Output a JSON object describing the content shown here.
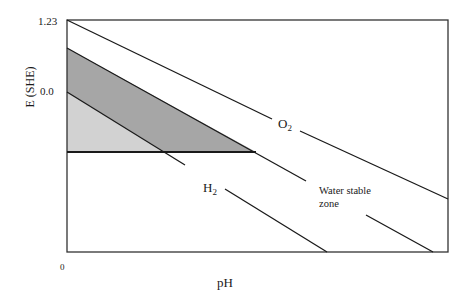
{
  "diagram": {
    "type": "pourbaix_water_stability",
    "y_axis": {
      "label": "E (SHE)",
      "ticks": [
        "1.23",
        "0.0"
      ]
    },
    "x_axis": {
      "label": "pH",
      "ticks": [
        "0"
      ]
    },
    "lines": {
      "o2": {
        "label": "O",
        "subscript": "2"
      },
      "h2": {
        "label": "H",
        "subscript": "2"
      }
    },
    "annotations": {
      "stable_zone_line1": "Water stable",
      "stable_zone_line2": "zone"
    },
    "colors": {
      "dark_band": "#a6a6a6",
      "light_band": "#d2d2d2",
      "line": "#1a1a1a",
      "frame": "#333333"
    }
  }
}
